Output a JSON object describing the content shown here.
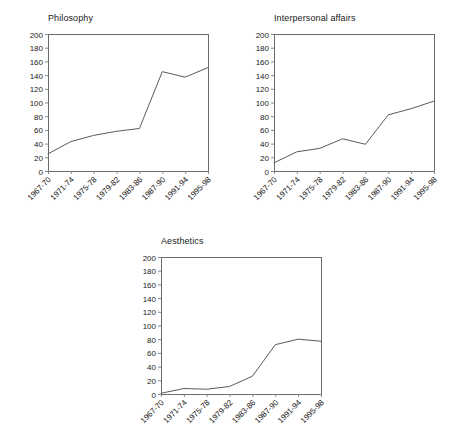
{
  "figure": {
    "background_color": "#ffffff",
    "line_color": "#5a5a5a",
    "axis_color": "#6b6b6b",
    "text_color": "#1a1a1a"
  },
  "chart_data": [
    {
      "type": "line",
      "title": "Philosophy",
      "xlabel": "",
      "ylabel": "",
      "categories": [
        "1967-70",
        "1971-74",
        "1975-78",
        "1979-82",
        "1983-86",
        "1987-90",
        "1991-94",
        "1995-98"
      ],
      "values": [
        25,
        43,
        52,
        58,
        62,
        145,
        137,
        151
      ],
      "ylim": [
        0,
        200
      ],
      "yticks": [
        0,
        20,
        40,
        60,
        80,
        100,
        120,
        140,
        160,
        180,
        200
      ],
      "grid": false,
      "legend": "none"
    },
    {
      "type": "line",
      "title": "Interpersonal affairs",
      "xlabel": "",
      "ylabel": "",
      "categories": [
        "1967-70",
        "1971-74",
        "1975-78",
        "1979-82",
        "1983-86",
        "1987-90",
        "1991-94",
        "1995-98"
      ],
      "values": [
        12,
        28,
        33,
        47,
        39,
        82,
        91,
        102
      ],
      "ylim": [
        0,
        200
      ],
      "yticks": [
        0,
        20,
        40,
        60,
        80,
        100,
        120,
        140,
        160,
        180,
        200
      ],
      "grid": false,
      "legend": "none"
    },
    {
      "type": "line",
      "title": "Aesthetics",
      "xlabel": "",
      "ylabel": "",
      "categories": [
        "1967-70",
        "1971-74",
        "1975-78",
        "1979-82",
        "1983-86",
        "1987-90",
        "1991-94",
        "1995-98"
      ],
      "values": [
        1,
        8,
        7,
        11,
        26,
        72,
        80,
        77
      ],
      "ylim": [
        0,
        200
      ],
      "yticks": [
        0,
        20,
        40,
        60,
        80,
        100,
        120,
        140,
        160,
        180,
        200
      ],
      "grid": false,
      "legend": "none"
    }
  ]
}
